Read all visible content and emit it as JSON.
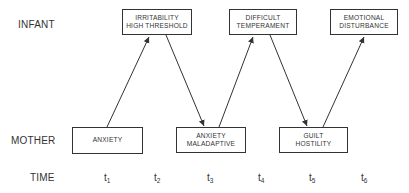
{
  "diagram": {
    "rows": {
      "infant": "INFANT",
      "mother": "MOTHER",
      "time": "TIME"
    },
    "infant_nodes": [
      {
        "id": "irritability",
        "line1": "IRRITABILITY",
        "line2": "HIGH THRESHOLD",
        "time": "t2"
      },
      {
        "id": "difficult",
        "line1": "DIFFICULT",
        "line2": "TEMPERAMENT",
        "time": "t4"
      },
      {
        "id": "emotional",
        "line1": "EMOTIONAL",
        "line2": "DISTURBANCE",
        "time": "t6"
      }
    ],
    "mother_nodes": [
      {
        "id": "anxiety",
        "line1": "ANXIETY",
        "line2": "",
        "time": "t1"
      },
      {
        "id": "anxiety-maladaptive",
        "line1": "ANXIETY",
        "line2": "MALADAPTIVE",
        "time": "t3"
      },
      {
        "id": "guilt",
        "line1": "GUILT",
        "line2": "HOSTILITY",
        "time": "t5"
      }
    ],
    "edges": [
      {
        "from": "anxiety",
        "to": "irritability"
      },
      {
        "from": "irritability",
        "to": "anxiety-maladaptive"
      },
      {
        "from": "anxiety-maladaptive",
        "to": "difficult"
      },
      {
        "from": "difficult",
        "to": "guilt"
      },
      {
        "from": "guilt",
        "to": "emotional"
      }
    ],
    "time_ticks": [
      {
        "base": "t",
        "sub": "1"
      },
      {
        "base": "t",
        "sub": "2"
      },
      {
        "base": "t",
        "sub": "3"
      },
      {
        "base": "t",
        "sub": "4"
      },
      {
        "base": "t",
        "sub": "5"
      },
      {
        "base": "t",
        "sub": "6"
      }
    ],
    "colors": {
      "line": "#333333",
      "background": "#ffffff"
    }
  }
}
